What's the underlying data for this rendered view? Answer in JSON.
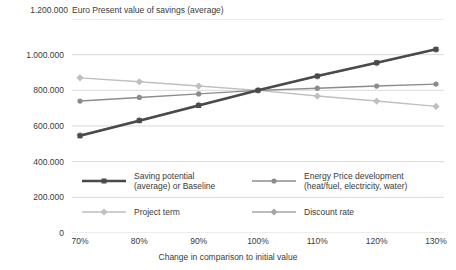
{
  "chart_data": {
    "type": "line",
    "title": "Euro Present value of savings (average)",
    "xlabel": "Change in comparison to initial value",
    "ylabel": "",
    "categories": [
      "70%",
      "80%",
      "90%",
      "100%",
      "110%",
      "120%",
      "130%"
    ],
    "x": [
      70,
      80,
      90,
      100,
      110,
      120,
      130
    ],
    "ylim": [
      0,
      1200000
    ],
    "xlim": [
      70,
      130
    ],
    "grid": true,
    "legend_position": "inside-bottom",
    "ytick_labels": [
      "0",
      "200.000",
      "400.000",
      "600.000",
      "800.000",
      "1.000.000",
      "1.200.000"
    ],
    "ytick_values": [
      0,
      200000,
      400000,
      600000,
      800000,
      1000000,
      1200000
    ],
    "series": [
      {
        "name": "Saving potential (average) or Baseline",
        "legend_line1": "Saving potential",
        "legend_line2": "(average) or Baseline",
        "color": "#4a4a4a",
        "marker": "square",
        "width": 2.6,
        "values": [
          545000,
          630000,
          715000,
          800000,
          880000,
          955000,
          1030000
        ]
      },
      {
        "name": "Energy Price development (heat/fuel, electricity, water)",
        "legend_line1": "Energy Price development",
        "legend_line2": "(heat/fuel, electricity, water)",
        "color": "#8c8c8c",
        "marker": "circle",
        "width": 1.4,
        "values": [
          740000,
          760000,
          780000,
          800000,
          812000,
          824000,
          835000
        ]
      },
      {
        "name": "Project term",
        "legend_line1": "Project term",
        "legend_line2": "",
        "color": "#bfbfbf",
        "marker": "diamond",
        "width": 1.4,
        "values": [
          870000,
          848000,
          824000,
          800000,
          768000,
          740000,
          710000
        ]
      },
      {
        "name": "Discount rate",
        "legend_line1": "Discount rate",
        "legend_line2": "",
        "color": "#a6a6a6",
        "marker": "diamond",
        "width": 1.4,
        "values": [
          548000,
          633000,
          718000,
          800000,
          878000,
          953000,
          1028000
        ]
      }
    ]
  },
  "axis": {
    "top_tick_label": "1.200.000"
  },
  "colors": {
    "gridline": "#cfcfcf",
    "text": "#3a3a3a",
    "background": "#ffffff"
  }
}
